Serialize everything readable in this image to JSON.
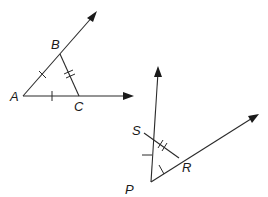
{
  "figure": {
    "triangle_1": {
      "vertices": [
        {
          "name": "A",
          "label": "A"
        },
        {
          "name": "B",
          "label": "B"
        },
        {
          "name": "C",
          "label": "C"
        }
      ],
      "marks": {
        "AB": "single tick",
        "AC": "single tick",
        "BC": "double tick"
      }
    },
    "triangle_2": {
      "vertices": [
        {
          "name": "P",
          "label": "P"
        },
        {
          "name": "S",
          "label": "S"
        },
        {
          "name": "R",
          "label": "R"
        }
      ],
      "marks": {
        "PS": "single tick",
        "PR": "single tick",
        "SR": "double tick"
      }
    },
    "colors": {
      "stroke": "#2a2a2a",
      "background": "#ffffff"
    }
  }
}
